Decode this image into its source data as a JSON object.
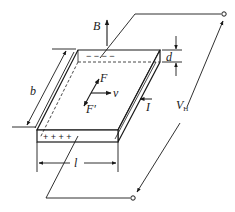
{
  "diagram": {
    "labels": {
      "magnetic_field": "B",
      "force": "F",
      "force_prime": "F′",
      "velocity": "v",
      "current": "I",
      "width": "b",
      "thickness": "d",
      "length": "l",
      "hall_voltage_main": "V",
      "hall_voltage_sub": "H"
    },
    "charges": {
      "top_face": "−  −  −  −",
      "front_face": "+   +   +   +"
    },
    "colors": {
      "stroke": "#1a1a1a",
      "background": "#ffffff"
    }
  }
}
